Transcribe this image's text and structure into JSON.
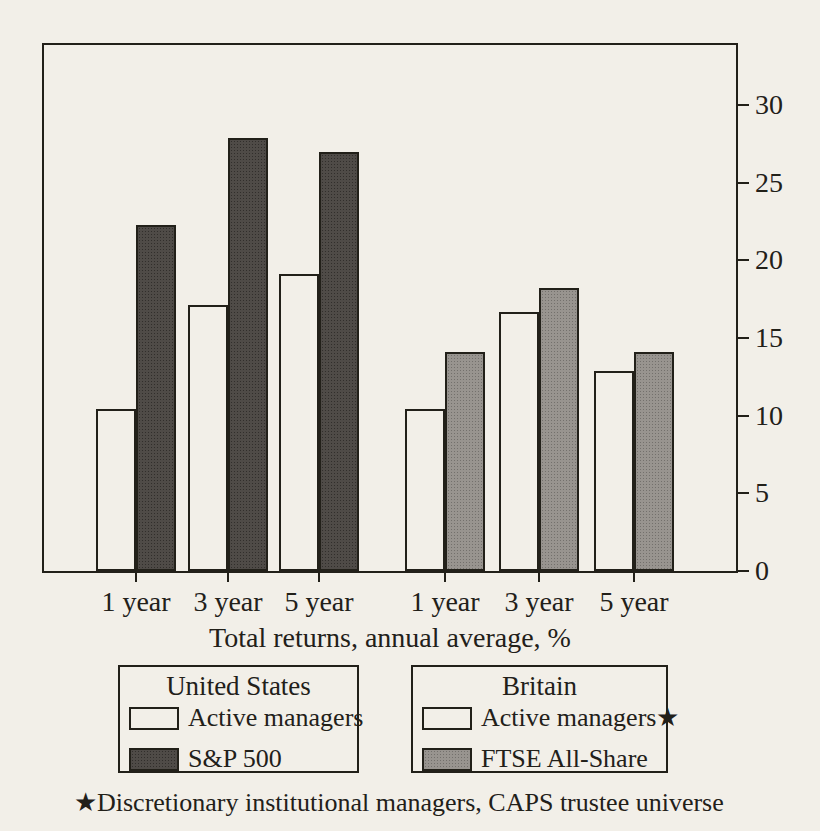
{
  "colors": {
    "paper": "#f2efe8",
    "ink": "#222019",
    "bar_dark": "#4f4b47",
    "bar_dark_dot": "#312e2b",
    "bar_gray": "#98948f",
    "bar_gray_dot": "#73706c"
  },
  "chart_data": {
    "type": "bar",
    "title": "",
    "xlabel": "Total returns, annual average, %",
    "ylabel": "",
    "ylim": [
      0,
      32
    ],
    "yticks": [
      0,
      5,
      10,
      15,
      20,
      25,
      30
    ],
    "axis_side": "right",
    "grid": false,
    "legend_position": "bottom",
    "groups": [
      {
        "name": "United States",
        "categories": [
          "1 year",
          "3 year",
          "5 year"
        ],
        "series": [
          {
            "name": "Active managers",
            "fill": "white",
            "values": [
              10.4,
              17.1,
              19.1
            ]
          },
          {
            "name": "S&P 500",
            "fill": "dark",
            "values": [
              22.3,
              27.9,
              27.0
            ]
          }
        ]
      },
      {
        "name": "Britain",
        "categories": [
          "1 year",
          "3 year",
          "5 year"
        ],
        "series": [
          {
            "name": "Active managers★",
            "fill": "white",
            "values": [
              10.4,
              16.7,
              12.9
            ]
          },
          {
            "name": "FTSE All-Share",
            "fill": "grayfill",
            "values": [
              14.1,
              18.2,
              14.1
            ]
          }
        ]
      }
    ]
  },
  "footnote": "★Discretionary institutional managers, CAPS trustee universe"
}
